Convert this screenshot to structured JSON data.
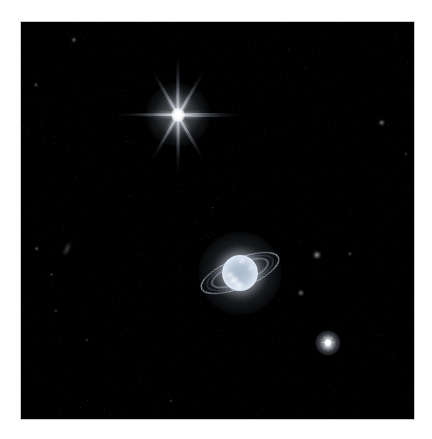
{
  "image": {
    "title": "Neptune and Rings (Infrared)",
    "subject": "Neptune",
    "frame": {
      "x": 21,
      "y": 22,
      "width": 393,
      "height": 397,
      "background_color": "#000000",
      "margin_color": "#ffffff",
      "border_color": "#c9c9c9"
    }
  },
  "objects": {
    "diffraction_star": {
      "name": "Triton",
      "label": "bright-star-triton",
      "cx": 178,
      "cy": 115,
      "core_radius": 7,
      "spike_length": 56,
      "color": "#ffffff",
      "spike_angles_deg": [
        0,
        60,
        90,
        120,
        180,
        240,
        270,
        300
      ],
      "point_count": 8
    },
    "planet": {
      "name": "Neptune",
      "label": "planet-neptune",
      "cx": 240,
      "cy": 273,
      "disk_radius": 18,
      "glow_radius": 36,
      "disk_color": "#dfe6ee",
      "limb_color": "#f4f8ff",
      "rings": [
        {
          "name": "outer-ring-adams",
          "rx": 42,
          "ry": 15,
          "tilt_deg": -22,
          "thickness": 1.1,
          "color": "#c8d4e2",
          "opacity": 0.85
        },
        {
          "name": "inner-ring-lassell",
          "rx": 31,
          "ry": 11,
          "tilt_deg": -22,
          "thickness": 2.4,
          "color": "#9fb0c4",
          "opacity": 0.5
        },
        {
          "name": "dust-band",
          "rx": 36,
          "ry": 13,
          "tilt_deg": -22,
          "thickness": 1.6,
          "color": "#8fa2b8",
          "opacity": 0.35
        }
      ],
      "cloud_features": [
        {
          "name": "south-bright-cloud",
          "dx": -6,
          "dy": 7,
          "r": 5,
          "brightness": 0.95
        },
        {
          "name": "southwest-cloud",
          "dx": -10,
          "dy": 2,
          "r": 4,
          "brightness": 0.8
        },
        {
          "name": "south-pole-glow",
          "dx": -1,
          "dy": 12,
          "r": 5,
          "brightness": 0.85
        },
        {
          "name": "north-limb-cloud",
          "dx": 2,
          "dy": -12,
          "r": 4,
          "brightness": 0.7
        },
        {
          "name": "east-limb-cloud",
          "dx": 11,
          "dy": -5,
          "r": 3,
          "brightness": 0.6
        }
      ]
    },
    "point_stars": [
      {
        "name": "bright-star-lower-right",
        "cx": 327,
        "cy": 342,
        "r": 4.2,
        "brightness": 1.0,
        "spikes": true
      },
      {
        "name": "faint-star-upper-right",
        "cx": 381,
        "cy": 122,
        "r": 1.6,
        "brightness": 0.45,
        "spikes": false
      },
      {
        "name": "faint-star-upper-left",
        "cx": 73,
        "cy": 39,
        "r": 1.3,
        "brightness": 0.38,
        "spikes": false
      },
      {
        "name": "faint-star-left",
        "cx": 35,
        "cy": 84,
        "r": 1.1,
        "brightness": 0.3,
        "spikes": false
      },
      {
        "name": "moon-galatea",
        "cx": 316,
        "cy": 254,
        "r": 1.9,
        "brightness": 0.55,
        "spikes": false
      },
      {
        "name": "moon-despina",
        "cx": 300,
        "cy": 292,
        "r": 1.5,
        "brightness": 0.42,
        "spikes": false
      },
      {
        "name": "faint-star-mid-left",
        "cx": 36,
        "cy": 248,
        "r": 1.2,
        "brightness": 0.32,
        "spikes": false
      },
      {
        "name": "faint-star-lower-left",
        "cx": 51,
        "cy": 274,
        "r": 1.0,
        "brightness": 0.26,
        "spikes": false
      },
      {
        "name": "faint-star-lower-left-2",
        "cx": 55,
        "cy": 310,
        "r": 0.9,
        "brightness": 0.24,
        "spikes": false
      },
      {
        "name": "faint-star-bottom",
        "cx": 86,
        "cy": 339,
        "r": 0.9,
        "brightness": 0.22,
        "spikes": false
      },
      {
        "name": "faint-star-bottom-mid",
        "cx": 170,
        "cy": 400,
        "r": 0.9,
        "brightness": 0.2,
        "spikes": false
      },
      {
        "name": "faint-star-right-mid",
        "cx": 349,
        "cy": 253,
        "r": 1.1,
        "brightness": 0.28,
        "spikes": false
      },
      {
        "name": "faint-star-far-right",
        "cx": 405,
        "cy": 153,
        "r": 0.9,
        "brightness": 0.22,
        "spikes": false
      },
      {
        "name": "faint-star-center",
        "cx": 212,
        "cy": 207,
        "r": 0.8,
        "brightness": 0.18,
        "spikes": false
      }
    ],
    "galaxies": [
      {
        "name": "edge-on-galaxy",
        "cx": 67,
        "cy": 249,
        "rx": 7,
        "ry": 2,
        "tilt_deg": -65,
        "brightness": 0.35
      }
    ]
  }
}
